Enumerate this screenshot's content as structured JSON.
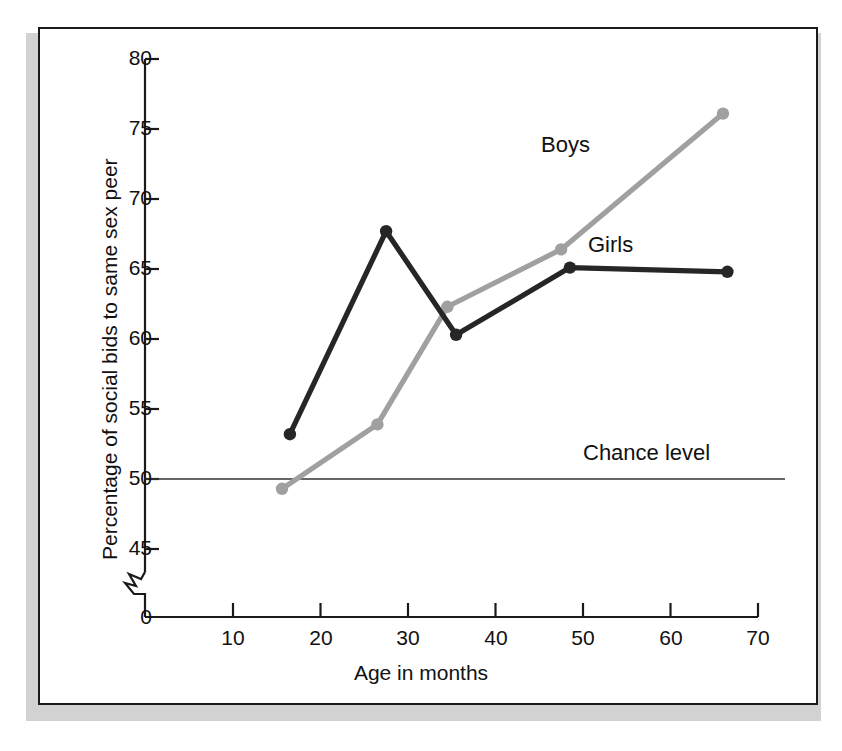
{
  "chart_data": {
    "type": "line",
    "title": "",
    "xlabel": "Age in months",
    "ylabel": "Percentage of social bids to same sex peer",
    "xlim": [
      0,
      70
    ],
    "ylim": [
      0,
      80
    ],
    "y_axis_break": true,
    "y_break_between": [
      0,
      45
    ],
    "grid": false,
    "legend_position": "inline-annotations",
    "xticks": [
      "10",
      "20",
      "30",
      "40",
      "50",
      "60",
      "70"
    ],
    "xtick_values": [
      10,
      20,
      30,
      40,
      50,
      60,
      70
    ],
    "yticks": [
      "0",
      "45",
      "50",
      "55",
      "60",
      "65",
      "70",
      "75",
      "80"
    ],
    "ytick_values": [
      0,
      45,
      50,
      55,
      60,
      65,
      70,
      75,
      80
    ],
    "series": [
      {
        "name": "Boys",
        "color": "#a0a0a0",
        "marker": "circle",
        "x": [
          15.6,
          26.5,
          34.5,
          47.5,
          66.0
        ],
        "values": [
          49.3,
          53.9,
          62.3,
          66.4,
          76.1
        ]
      },
      {
        "name": "Girls",
        "color": "#262626",
        "marker": "circle",
        "x": [
          16.5,
          27.5,
          35.5,
          48.5,
          66.5
        ],
        "values": [
          53.2,
          67.7,
          60.3,
          65.1,
          64.8
        ]
      }
    ],
    "reference_lines": [
      {
        "name": "Chance level",
        "label": "Chance level",
        "y": 50,
        "color": "#333333"
      }
    ],
    "annotations": [
      {
        "text": "Boys",
        "x": 45.0,
        "y": 71.8
      },
      {
        "text": "Girls",
        "x": 50.5,
        "y": 64.7
      },
      {
        "text": "Chance level",
        "x": 50.0,
        "y": 52.5
      }
    ]
  }
}
